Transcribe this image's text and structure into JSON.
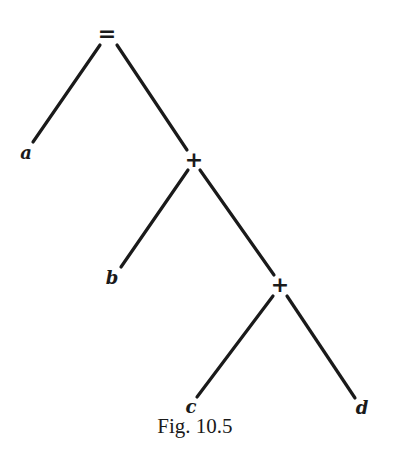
{
  "figure": {
    "caption": "Fig. 10.5",
    "nodes": {
      "root": {
        "label": "=",
        "type": "operator"
      },
      "a": {
        "label": "a",
        "type": "leaf"
      },
      "plus1": {
        "label": "+",
        "type": "operator"
      },
      "b": {
        "label": "b",
        "type": "leaf"
      },
      "plus2": {
        "label": "+",
        "type": "operator"
      },
      "c": {
        "label": "c",
        "type": "leaf"
      },
      "d": {
        "label": "d",
        "type": "leaf"
      }
    },
    "edges": [
      [
        "root",
        "a"
      ],
      [
        "root",
        "plus1"
      ],
      [
        "plus1",
        "b"
      ],
      [
        "plus1",
        "plus2"
      ],
      [
        "plus2",
        "c"
      ],
      [
        "plus2",
        "d"
      ]
    ],
    "colors": {
      "ink": "#1a1a1a",
      "background": "#ffffff"
    }
  }
}
